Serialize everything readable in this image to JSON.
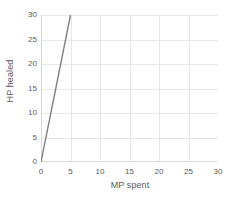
{
  "chart_data": {
    "type": "line",
    "title": "",
    "xlabel": "MP spent",
    "ylabel": "HP healed",
    "xlim": [
      0,
      30
    ],
    "ylim": [
      0,
      30
    ],
    "xticks": [
      0,
      5,
      10,
      15,
      20,
      25,
      30
    ],
    "yticks": [
      0,
      5,
      10,
      15,
      20,
      25,
      30
    ],
    "xtick_labels": [
      "0",
      "5",
      "10",
      "15",
      "20",
      "25",
      "30"
    ],
    "ytick_labels": [
      "0",
      "5",
      "10",
      "15",
      "20",
      "25",
      "30"
    ],
    "grid": true,
    "legend": false,
    "legend_position": "none",
    "series": [
      {
        "name": "HP healed",
        "color": "#808080",
        "x": [
          0,
          5
        ],
        "y": [
          0,
          30
        ],
        "slope": 6,
        "intercept": 0
      }
    ],
    "colors": {
      "line": "#808080",
      "grid": "#e8e8e8",
      "axis": "#d9d9d9",
      "text": "#5a5a5a",
      "background": "#ffffff"
    }
  }
}
